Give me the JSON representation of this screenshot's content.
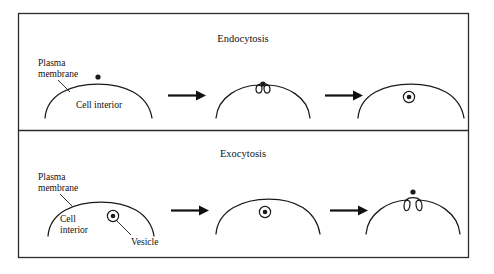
{
  "figure": {
    "caption_alt": "Endocytosis and exocytosis across the plasma membrane",
    "background_color": "#ffffff",
    "ink_color": "#1a1a1a",
    "frame_color": "#2b2b2b"
  },
  "panels": [
    {
      "id": "endocytosis",
      "title": "Endocytosis",
      "labels": {
        "plasma_membrane_line1": "Plasma",
        "plasma_membrane_line2": "membrane",
        "cell_interior": "Cell interior"
      },
      "stages": [
        {
          "index": 1,
          "name": "particle-outside-membrane",
          "description": "Particle outside an intact plasma membrane above the cell interior"
        },
        {
          "index": 2,
          "name": "membrane-invagination",
          "description": "Plasma membrane invaginates forming a pit around the particle"
        },
        {
          "index": 3,
          "name": "vesicle-internalized",
          "description": "Vesicle containing the particle is released inside the cell"
        }
      ],
      "arrows": [
        {
          "index": 1,
          "name": "stage-arrow-1",
          "direction": "right"
        },
        {
          "index": 2,
          "name": "stage-arrow-2",
          "direction": "right"
        }
      ]
    },
    {
      "id": "exocytosis",
      "title": "Exocytosis",
      "labels": {
        "plasma_membrane_line1": "Plasma",
        "plasma_membrane_line2": "membrane",
        "cell_interior_line1": "Cell",
        "cell_interior_line2": "interior",
        "vesicle": "Vesicle"
      },
      "stages": [
        {
          "index": 1,
          "name": "vesicle-in-cytoplasm",
          "description": "Vesicle carrying cargo sits within the cell interior"
        },
        {
          "index": 2,
          "name": "vesicle-approaching-membrane",
          "description": "Vesicle moves toward the plasma membrane"
        },
        {
          "index": 3,
          "name": "vesicle-fused-cargo-released",
          "description": "Vesicle fuses with the plasma membrane and the cargo is released outside"
        }
      ],
      "arrows": [
        {
          "index": 1,
          "name": "stage-arrow-1",
          "direction": "right"
        },
        {
          "index": 2,
          "name": "stage-arrow-2",
          "direction": "right"
        }
      ]
    }
  ]
}
